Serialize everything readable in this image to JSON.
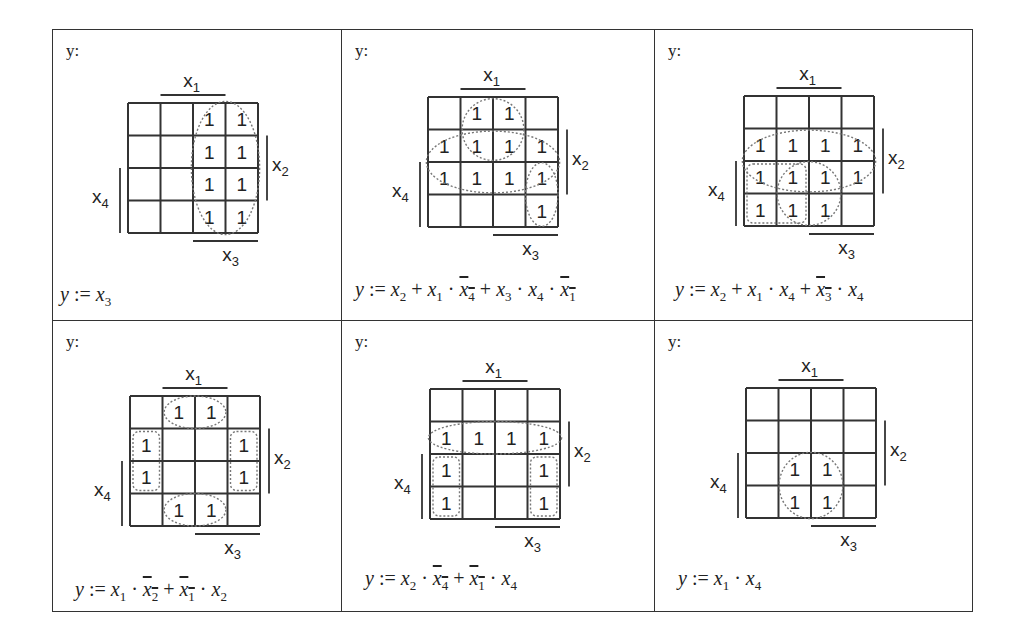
{
  "figure": {
    "output_label": "y:",
    "var_labels": {
      "top": "x1",
      "right": "x2",
      "bottom": "x3",
      "left": "x4"
    },
    "panels": [
      {
        "id": 1,
        "grid": [
          [
            0,
            0,
            1,
            1
          ],
          [
            0,
            0,
            1,
            1
          ],
          [
            0,
            0,
            1,
            1
          ],
          [
            0,
            0,
            1,
            1
          ]
        ],
        "groups": [
          {
            "type": "ellipse",
            "cells": "cols 2-3, rows 0-3",
            "style": "dotted"
          }
        ],
        "formula_text": "y := x3",
        "formula_terms": [
          {
            "var": "x",
            "sub": "3",
            "neg": false
          }
        ]
      },
      {
        "id": 2,
        "grid": [
          [
            0,
            1,
            1,
            0
          ],
          [
            1,
            1,
            1,
            1
          ],
          [
            1,
            1,
            1,
            1
          ],
          [
            0,
            0,
            0,
            1
          ]
        ],
        "groups": [
          {
            "type": "ellipse",
            "cells": "rows 1-2, cols 0-3",
            "style": "dotted"
          },
          {
            "type": "ellipse",
            "cells": "rows 0-1, cols 1-2",
            "style": "dotted"
          },
          {
            "type": "ellipse",
            "cells": "rows 2-3, col 3",
            "style": "dotted"
          }
        ],
        "formula_text": "y := x2 + x1 · ¬x4 + x3 · x4 · ¬x1"
      },
      {
        "id": 3,
        "grid": [
          [
            0,
            0,
            0,
            0
          ],
          [
            1,
            1,
            1,
            1
          ],
          [
            1,
            1,
            1,
            1
          ],
          [
            1,
            1,
            1,
            0
          ]
        ],
        "groups": [
          {
            "type": "ellipse",
            "cells": "rows 1-2, cols 0-3",
            "style": "dotted"
          },
          {
            "type": "circle",
            "cells": "rows 2-3, cols 1-2",
            "style": "dotted"
          },
          {
            "type": "box",
            "cells": "rows 2-3, cols 0-1",
            "style": "dotted"
          }
        ],
        "formula_text": "y := x2 + x1 · x4 + ¬x3 · x4"
      },
      {
        "id": 4,
        "grid": [
          [
            0,
            1,
            1,
            0
          ],
          [
            1,
            0,
            0,
            1
          ],
          [
            1,
            0,
            0,
            1
          ],
          [
            0,
            1,
            1,
            0
          ]
        ],
        "groups": [
          {
            "type": "ellipse",
            "cells": "row 0, cols 1-2",
            "style": "dotted"
          },
          {
            "type": "ellipse",
            "cells": "row 3, cols 1-2",
            "style": "dotted"
          },
          {
            "type": "box",
            "cells": "rows 1-2, col 0",
            "style": "dotted"
          },
          {
            "type": "box",
            "cells": "rows 1-2, col 3",
            "style": "dotted"
          }
        ],
        "formula_text": "y := x1 · ¬x2 + ¬x1 · x2"
      },
      {
        "id": 5,
        "grid": [
          [
            0,
            0,
            0,
            0
          ],
          [
            1,
            1,
            1,
            1
          ],
          [
            1,
            0,
            0,
            1
          ],
          [
            1,
            0,
            0,
            1
          ]
        ],
        "groups": [
          {
            "type": "ellipse",
            "cells": "row 1, cols 0-3",
            "style": "dotted"
          },
          {
            "type": "box",
            "cells": "rows 2-3, col 0",
            "style": "dotted"
          },
          {
            "type": "box",
            "cells": "rows 2-3, col 3",
            "style": "dotted"
          }
        ],
        "formula_text": "y := x2 · ¬x4 + ¬x1 · x4"
      },
      {
        "id": 6,
        "grid": [
          [
            0,
            0,
            0,
            0
          ],
          [
            0,
            0,
            0,
            0
          ],
          [
            0,
            1,
            1,
            0
          ],
          [
            0,
            1,
            1,
            0
          ]
        ],
        "groups": [
          {
            "type": "circle",
            "cells": "rows 2-3, cols 1-2",
            "style": "dotted"
          }
        ],
        "formula_text": "y := x1 · x4"
      }
    ]
  },
  "colors": {
    "line": "#333333",
    "text": "#222222",
    "group": "#777777",
    "background": "#ffffff"
  }
}
